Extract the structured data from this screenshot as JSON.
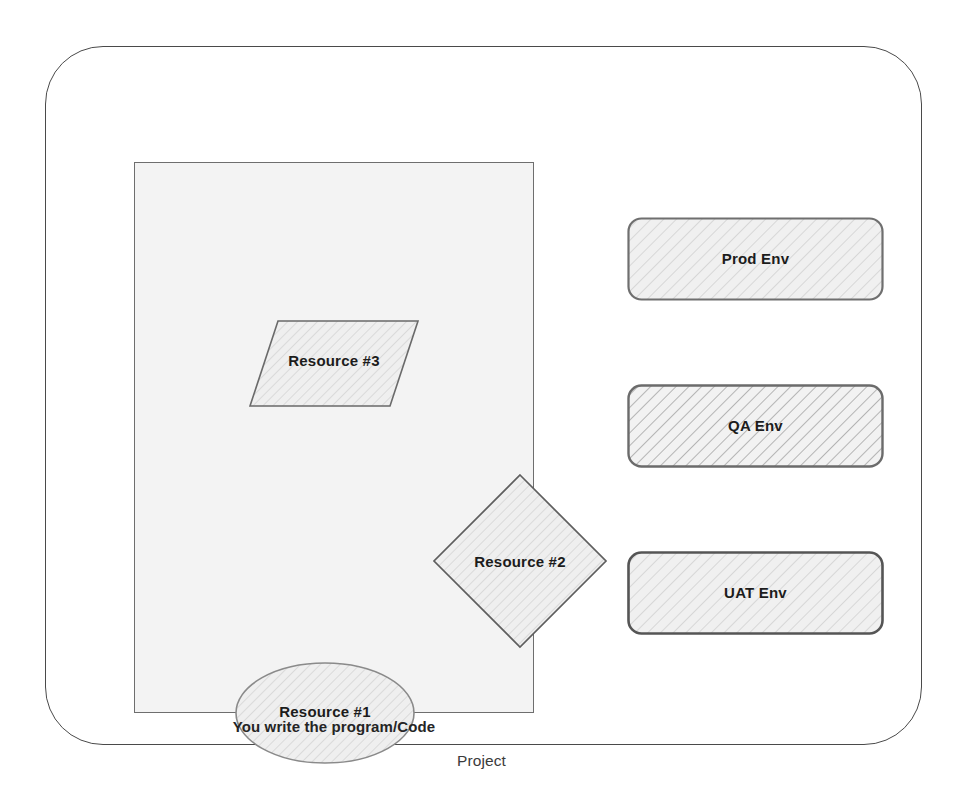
{
  "diagram": {
    "caption": "Project",
    "code_panel": {
      "caption": "You write the program/Code",
      "resources": [
        {
          "id": "resource-1",
          "label": "Resource #1",
          "shape": "ellipse"
        },
        {
          "id": "resource-2",
          "label": "Resource #2",
          "shape": "diamond"
        },
        {
          "id": "resource-3",
          "label": "Resource #3",
          "shape": "parallelogram"
        }
      ]
    },
    "environments": [
      {
        "id": "env-prod",
        "label": "Prod Env",
        "shape": "rounded-rectangle",
        "hatch": "light"
      },
      {
        "id": "env-qa",
        "label": "QA Env",
        "shape": "rounded-rectangle",
        "hatch": "dark"
      },
      {
        "id": "env-uat",
        "label": "UAT Env",
        "shape": "rounded-rectangle",
        "hatch": "light"
      }
    ]
  },
  "colors": {
    "outline": "#4a4a4a",
    "panel_outline": "#6e6e6e",
    "panel_fill": "#f3f3f3",
    "shape_fill": "#ededed",
    "hatch_light": "#c9c9c9",
    "hatch_dark": "#b0b0b0",
    "text": "#1c1c1c",
    "page_background": "#ffffff"
  }
}
